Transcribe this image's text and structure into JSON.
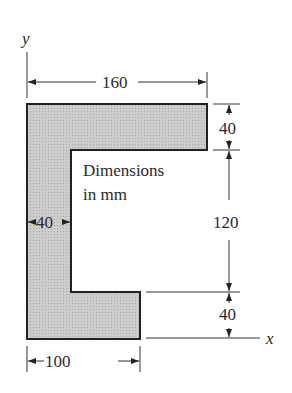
{
  "diagram": {
    "type": "cross-section",
    "note_line1": "Dimensions",
    "note_line2": "in mm",
    "axes": {
      "x_label": "x",
      "y_label": "y"
    },
    "dimensions": {
      "top_width": "160",
      "bottom_width": "100",
      "web_thickness": "40",
      "top_flange_height": "40",
      "middle_height": "120",
      "bottom_flange_height": "40"
    },
    "colors": {
      "fill": "#c8c8c8",
      "outline": "#222222",
      "line": "#333333"
    }
  }
}
